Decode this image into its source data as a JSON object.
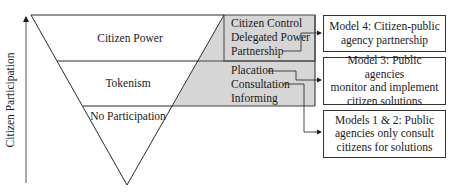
{
  "axis": {
    "label": "Citizen Participation"
  },
  "triangle": {
    "levels": [
      {
        "label": "Citizen Power"
      },
      {
        "label": "Tokenism"
      },
      {
        "label": "No Participation"
      }
    ]
  },
  "rungs": {
    "citizen_power": [
      "Citizen Control",
      "Delegated Power",
      "Partnership"
    ],
    "tokenism": [
      "Placation",
      "Consultation",
      "Informing"
    ]
  },
  "models": [
    {
      "line1": "Model 4: Citizen-public",
      "line2": "agency partnership",
      "line3": ""
    },
    {
      "line1": "Model 3: Public agencies",
      "line2": "monitor and implement",
      "line3": "citizen solutions"
    },
    {
      "line1": "Models 1 & 2: Public",
      "line2": "agencies only consult",
      "line3": "citizens for solutions"
    }
  ],
  "colors": {
    "shade": "#d6d6d6",
    "line": "#2a2a2a"
  }
}
